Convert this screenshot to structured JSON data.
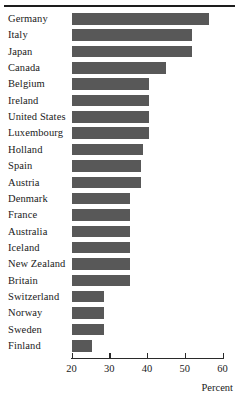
{
  "figure": {
    "rule_visible": true,
    "bar_color": "#585858",
    "axis_color": "#2a2a2a",
    "text_color": "#1a1a1a"
  },
  "chart_data": {
    "type": "bar",
    "orientation": "horizontal",
    "title": "",
    "subtitle": "",
    "xlabel": "Percent",
    "ylabel": "",
    "xlim": [
      20,
      60
    ],
    "ylim": null,
    "grid": false,
    "legend": null,
    "xticks": [
      20,
      30,
      40,
      50,
      60
    ],
    "xticklabels": [
      "20",
      "30",
      "40",
      "50",
      "60"
    ],
    "categories": [
      "Germany",
      "Italy",
      "Japan",
      "Canada",
      "Belgium",
      "Ireland",
      "United States",
      "Luxembourg",
      "Holland",
      "Spain",
      "Austria",
      "Denmark",
      "France",
      "Australia",
      "Iceland",
      "New Zealand",
      "Britain",
      "Switzerland",
      "Norway",
      "Sweden",
      "Finland"
    ],
    "values": [
      56.5,
      52.0,
      52.0,
      45.0,
      40.5,
      40.5,
      40.5,
      40.5,
      39.0,
      38.5,
      38.5,
      35.5,
      35.5,
      35.5,
      35.5,
      35.5,
      35.5,
      28.5,
      28.5,
      28.5,
      25.5
    ]
  }
}
